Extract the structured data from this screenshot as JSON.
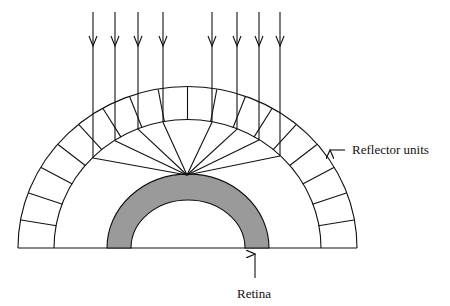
{
  "diagram": {
    "labels": {
      "reflector": "Reflector units",
      "retina": "Retina"
    },
    "colors": {
      "line": "#111111",
      "retina_fill": "#9a9a9a",
      "background": "#ffffff"
    },
    "incoming_rays": 8
  }
}
